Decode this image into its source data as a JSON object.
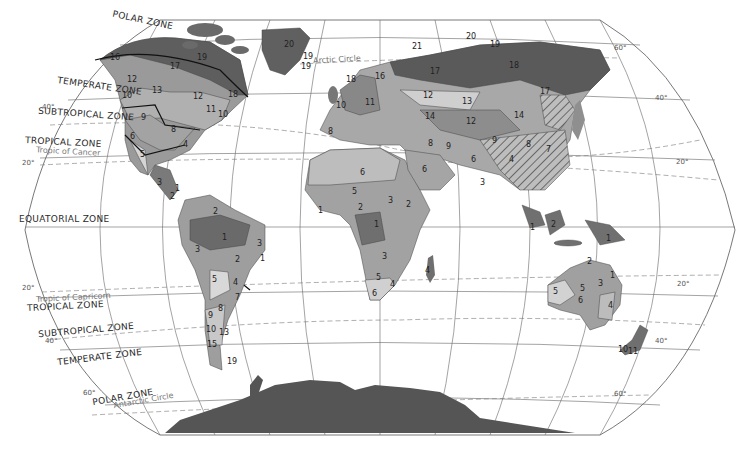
{
  "map": {
    "title": "World Climatic Zones",
    "zones": [
      {
        "id": "polar-north",
        "label": "POLAR ZONE",
        "x": 112,
        "y": 18,
        "rot": 12
      },
      {
        "id": "temperate-north",
        "label": "TEMPERATE ZONE",
        "x": 57,
        "y": 84,
        "rot": 8
      },
      {
        "id": "subtropical-north",
        "label": "SUBTROPICAL ZONE",
        "x": 38,
        "y": 112,
        "rot": 4
      },
      {
        "id": "tropical-north",
        "label": "TROPICAL ZONE",
        "x": 25,
        "y": 139,
        "rot": 3
      },
      {
        "id": "equatorial",
        "label": "EQUATORIAL ZONE",
        "x": 19,
        "y": 215,
        "rot": 0
      },
      {
        "id": "tropical-south",
        "label": "TROPICAL ZONE",
        "x": 27,
        "y": 303,
        "rot": -3
      },
      {
        "id": "subtropical-south",
        "label": "SUBTROPICAL ZONE",
        "x": 38,
        "y": 327,
        "rot": -5
      },
      {
        "id": "temperate-south",
        "label": "TEMPERATE ZONE",
        "x": 57,
        "y": 355,
        "rot": -7
      },
      {
        "id": "polar-south",
        "label": "POLAR ZONE",
        "x": 92,
        "y": 394,
        "rot": -10
      }
    ],
    "circles": [
      {
        "id": "arctic-circle",
        "label": "Arctic Circle",
        "x": 313,
        "y": 58,
        "rot": -3
      },
      {
        "id": "tropic-cancer",
        "label": "Tropic of Cancer",
        "x": 36,
        "y": 148,
        "rot": 3
      },
      {
        "id": "tropic-capricorn",
        "label": "Tropic of Capricorn",
        "x": 36,
        "y": 294,
        "rot": -3
      },
      {
        "id": "antarctic-circle",
        "label": "Antarctic Circle",
        "x": 113,
        "y": 398,
        "rot": -10
      }
    ],
    "degrees": [
      {
        "label": "40°",
        "x": 42,
        "y": 106
      },
      {
        "label": "20°",
        "x": 22,
        "y": 162
      },
      {
        "label": "20°",
        "x": 22,
        "y": 287
      },
      {
        "label": "40°",
        "x": 45,
        "y": 340
      },
      {
        "label": "60°",
        "x": 83,
        "y": 392
      },
      {
        "label": "60°",
        "x": 614,
        "y": 47
      },
      {
        "label": "40°",
        "x": 655,
        "y": 97
      },
      {
        "label": "20°",
        "x": 676,
        "y": 161
      },
      {
        "label": "20°",
        "x": 677,
        "y": 283
      },
      {
        "label": "40°",
        "x": 655,
        "y": 340
      },
      {
        "label": "60°",
        "x": 614,
        "y": 393
      }
    ],
    "region_numbers": [
      {
        "n": "16",
        "x": 110,
        "y": 58
      },
      {
        "n": "17",
        "x": 170,
        "y": 67
      },
      {
        "n": "19",
        "x": 197,
        "y": 58
      },
      {
        "n": "18",
        "x": 228,
        "y": 95
      },
      {
        "n": "12",
        "x": 127,
        "y": 80
      },
      {
        "n": "10",
        "x": 122,
        "y": 96
      },
      {
        "n": "13",
        "x": 152,
        "y": 91
      },
      {
        "n": "12",
        "x": 193,
        "y": 97
      },
      {
        "n": "11",
        "x": 206,
        "y": 110
      },
      {
        "n": "10",
        "x": 218,
        "y": 115
      },
      {
        "n": "9",
        "x": 141,
        "y": 118
      },
      {
        "n": "8",
        "x": 171,
        "y": 130
      },
      {
        "n": "6",
        "x": 130,
        "y": 137
      },
      {
        "n": "4",
        "x": 183,
        "y": 145
      },
      {
        "n": "5",
        "x": 140,
        "y": 155
      },
      {
        "n": "3",
        "x": 157,
        "y": 183
      },
      {
        "n": "2",
        "x": 170,
        "y": 197
      },
      {
        "n": "1",
        "x": 175,
        "y": 189
      },
      {
        "n": "2",
        "x": 213,
        "y": 212
      },
      {
        "n": "1",
        "x": 222,
        "y": 238
      },
      {
        "n": "3",
        "x": 195,
        "y": 250
      },
      {
        "n": "2",
        "x": 235,
        "y": 260
      },
      {
        "n": "3",
        "x": 257,
        "y": 244
      },
      {
        "n": "1",
        "x": 260,
        "y": 259
      },
      {
        "n": "5",
        "x": 212,
        "y": 280
      },
      {
        "n": "4",
        "x": 233,
        "y": 283
      },
      {
        "n": "7",
        "x": 235,
        "y": 298
      },
      {
        "n": "8",
        "x": 218,
        "y": 309
      },
      {
        "n": "9",
        "x": 208,
        "y": 316
      },
      {
        "n": "10",
        "x": 206,
        "y": 330
      },
      {
        "n": "13",
        "x": 219,
        "y": 333
      },
      {
        "n": "15",
        "x": 207,
        "y": 345
      },
      {
        "n": "19",
        "x": 227,
        "y": 362
      },
      {
        "n": "20",
        "x": 284,
        "y": 45
      },
      {
        "n": "19",
        "x": 303,
        "y": 57
      },
      {
        "n": "19",
        "x": 301,
        "y": 67
      },
      {
        "n": "18",
        "x": 346,
        "y": 80
      },
      {
        "n": "16",
        "x": 375,
        "y": 77
      },
      {
        "n": "10",
        "x": 336,
        "y": 106
      },
      {
        "n": "11",
        "x": 365,
        "y": 103
      },
      {
        "n": "12",
        "x": 423,
        "y": 96
      },
      {
        "n": "17",
        "x": 430,
        "y": 72
      },
      {
        "n": "13",
        "x": 462,
        "y": 102
      },
      {
        "n": "14",
        "x": 425,
        "y": 117
      },
      {
        "n": "12",
        "x": 466,
        "y": 122
      },
      {
        "n": "8",
        "x": 328,
        "y": 132
      },
      {
        "n": "8",
        "x": 428,
        "y": 144
      },
      {
        "n": "9",
        "x": 446,
        "y": 147
      },
      {
        "n": "9",
        "x": 492,
        "y": 141
      },
      {
        "n": "20",
        "x": 466,
        "y": 37
      },
      {
        "n": "21",
        "x": 412,
        "y": 47
      },
      {
        "n": "19",
        "x": 490,
        "y": 45
      },
      {
        "n": "18",
        "x": 509,
        "y": 66
      },
      {
        "n": "17",
        "x": 540,
        "y": 92
      },
      {
        "n": "14",
        "x": 514,
        "y": 116
      },
      {
        "n": "8",
        "x": 526,
        "y": 145
      },
      {
        "n": "7",
        "x": 546,
        "y": 150
      },
      {
        "n": "6",
        "x": 471,
        "y": 160
      },
      {
        "n": "4",
        "x": 509,
        "y": 160
      },
      {
        "n": "3",
        "x": 480,
        "y": 183
      },
      {
        "n": "6",
        "x": 360,
        "y": 173
      },
      {
        "n": "6",
        "x": 422,
        "y": 170
      },
      {
        "n": "5",
        "x": 352,
        "y": 192
      },
      {
        "n": "3",
        "x": 388,
        "y": 201
      },
      {
        "n": "2",
        "x": 358,
        "y": 208
      },
      {
        "n": "2",
        "x": 406,
        "y": 205
      },
      {
        "n": "1",
        "x": 318,
        "y": 211
      },
      {
        "n": "1",
        "x": 374,
        "y": 225
      },
      {
        "n": "3",
        "x": 382,
        "y": 257
      },
      {
        "n": "5",
        "x": 376,
        "y": 278
      },
      {
        "n": "4",
        "x": 390,
        "y": 285
      },
      {
        "n": "6",
        "x": 372,
        "y": 294
      },
      {
        "n": "4",
        "x": 425,
        "y": 271
      },
      {
        "n": "1",
        "x": 530,
        "y": 228
      },
      {
        "n": "2",
        "x": 551,
        "y": 225
      },
      {
        "n": "1",
        "x": 606,
        "y": 239
      },
      {
        "n": "2",
        "x": 587,
        "y": 262
      },
      {
        "n": "1",
        "x": 610,
        "y": 276
      },
      {
        "n": "3",
        "x": 598,
        "y": 284
      },
      {
        "n": "5",
        "x": 553,
        "y": 292
      },
      {
        "n": "5",
        "x": 580,
        "y": 289
      },
      {
        "n": "6",
        "x": 578,
        "y": 301
      },
      {
        "n": "4",
        "x": 608,
        "y": 306
      },
      {
        "n": "10",
        "x": 618,
        "y": 350
      },
      {
        "n": "11",
        "x": 628,
        "y": 352
      }
    ]
  }
}
